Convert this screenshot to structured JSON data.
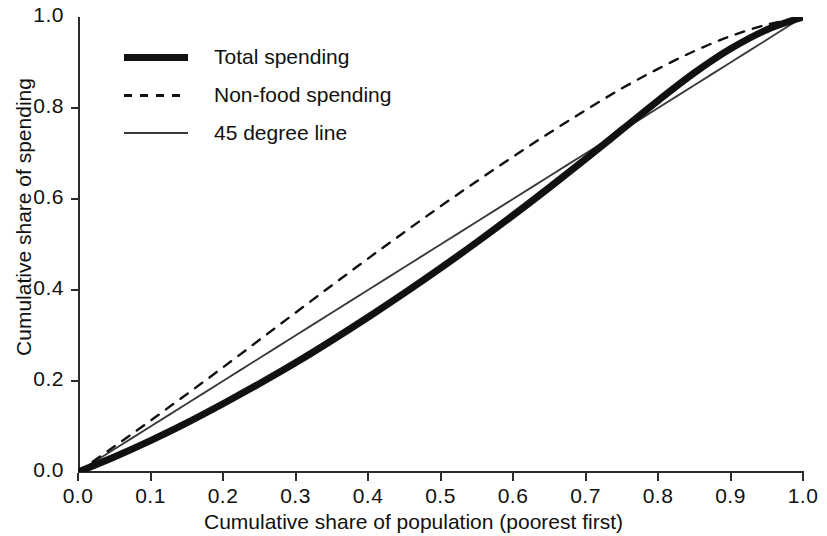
{
  "chart_data": {
    "type": "line",
    "title": "",
    "xlabel": "Cumulative share of population (poorest first)",
    "ylabel": "Cumulative share of spending",
    "xlim": [
      0.0,
      1.0
    ],
    "ylim": [
      0.0,
      1.0
    ],
    "grid": false,
    "legend_position": "top-left inside axes",
    "xticks": [
      "0.0",
      "0.1",
      "0.2",
      "0.3",
      "0.4",
      "0.5",
      "0.6",
      "0.7",
      "0.8",
      "0.9",
      "1.0"
    ],
    "yticks": [
      "0.0",
      "0.2",
      "0.4",
      "0.6",
      "0.8",
      "1.0"
    ],
    "xtick_values": [
      0.0,
      0.1,
      0.2,
      0.3,
      0.4,
      0.5,
      0.6,
      0.7,
      0.8,
      0.9,
      1.0
    ],
    "ytick_values": [
      0.0,
      0.2,
      0.4,
      0.6,
      0.8,
      1.0
    ],
    "x": [
      0.0,
      0.05,
      0.1,
      0.15,
      0.2,
      0.25,
      0.3,
      0.35,
      0.4,
      0.45,
      0.5,
      0.55,
      0.6,
      0.65,
      0.7,
      0.75,
      0.8,
      0.85,
      0.9,
      0.95,
      1.0
    ],
    "series": [
      {
        "name": "Total spending",
        "style": "thick-solid",
        "color": "#111111",
        "values": [
          0.0,
          0.033,
          0.069,
          0.108,
          0.15,
          0.194,
          0.24,
          0.289,
          0.34,
          0.393,
          0.448,
          0.505,
          0.564,
          0.625,
          0.688,
          0.752,
          0.816,
          0.877,
          0.93,
          0.972,
          1.0
        ]
      },
      {
        "name": "Non-food spending",
        "style": "dashed",
        "color": "#111111",
        "values": [
          0.0,
          0.056,
          0.113,
          0.171,
          0.23,
          0.29,
          0.35,
          0.41,
          0.469,
          0.527,
          0.584,
          0.639,
          0.693,
          0.745,
          0.795,
          0.843,
          0.886,
          0.925,
          0.958,
          0.983,
          1.0
        ]
      },
      {
        "name": "45 degree line",
        "style": "thin-solid",
        "color": "#3a3a3a",
        "values": [
          0.0,
          0.05,
          0.1,
          0.15,
          0.2,
          0.25,
          0.3,
          0.35,
          0.4,
          0.45,
          0.5,
          0.55,
          0.6,
          0.65,
          0.7,
          0.75,
          0.8,
          0.85,
          0.9,
          0.95,
          1.0
        ]
      }
    ]
  },
  "legend": {
    "entries": [
      {
        "label": "Total spending"
      },
      {
        "label": "Non-food spending"
      },
      {
        "label": "45 degree line"
      }
    ]
  }
}
